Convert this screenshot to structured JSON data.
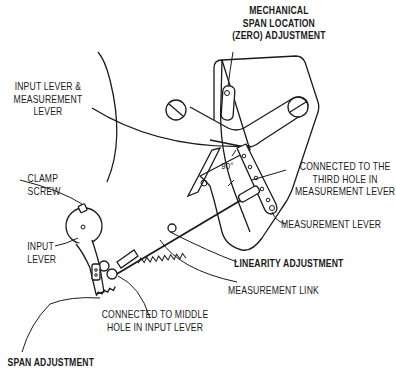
{
  "diagram": {
    "labels": {
      "mechanical_span": {
        "lines": [
          "MECHANICAL",
          "SPAN LOCATION",
          "(ZERO) ADJUSTMENT"
        ],
        "bold": true
      },
      "input_measurement_lever": {
        "lines": [
          "INPUT LEVER &",
          "MEASUREMENT",
          "LEVER"
        ],
        "bold": false
      },
      "clamp_screw": {
        "lines": [
          "CLAMP",
          "SCREW"
        ],
        "bold": false
      },
      "input_lever": {
        "lines": [
          "INPUT",
          "LEVER"
        ],
        "bold": false
      },
      "connected_third_hole": {
        "lines": [
          "CONNECTED TO THE",
          "THIRD HOLE IN",
          "MEASUREMENT LEVER"
        ],
        "bold": false
      },
      "measurement_lever": {
        "lines": [
          "MEASUREMENT LEVER"
        ],
        "bold": false
      },
      "linearity_adjustment": {
        "lines": [
          "LINEARITY ADJUSTMENT"
        ],
        "bold": true
      },
      "measurement_link": {
        "lines": [
          "MEASUREMENT LINK"
        ],
        "bold": false
      },
      "connected_middle_hole": {
        "lines": [
          "CONNECTED TO MIDDLE",
          "HOLE IN INPUT LEVER"
        ],
        "bold": false
      },
      "span_adjustment": {
        "lines": [
          "SPAN ADJUSTMENT"
        ],
        "bold": true
      },
      "angle": {
        "lines": [
          "90°"
        ],
        "bold": false
      }
    },
    "colors": {
      "ink": "#1a1a1a",
      "background": "#ffffff"
    }
  }
}
